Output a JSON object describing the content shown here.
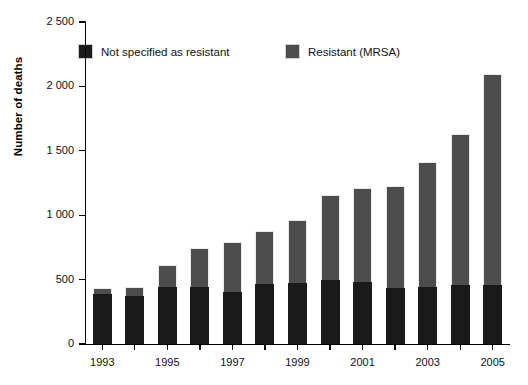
{
  "chart_data": {
    "type": "bar",
    "subtype": "stacked-bar",
    "title": "",
    "xlabel": "",
    "ylabel": "Number of deaths",
    "ylim": [
      0,
      2500
    ],
    "yticks": [
      0,
      500,
      1000,
      1500,
      2000,
      2500
    ],
    "ytick_labels": [
      "0",
      "500",
      "1 000",
      "1 500",
      "2 000",
      "2 500"
    ],
    "grid": false,
    "legend_position": "top-inside",
    "categories": [
      "1993",
      "1994",
      "1995",
      "1996",
      "1997",
      "1998",
      "1999",
      "2000",
      "2001",
      "2002",
      "2003",
      "2004",
      "2005"
    ],
    "xtick_labels_shown": [
      "1993",
      "",
      "1995",
      "",
      "1997",
      "",
      "1999",
      "",
      "2001",
      "",
      "2003",
      "",
      "2005"
    ],
    "series": [
      {
        "name": "Not specified as resistant",
        "color": "#1a1a1a",
        "values": [
          390,
          375,
          440,
          445,
          405,
          465,
          475,
          500,
          480,
          435,
          445,
          460,
          460
        ]
      },
      {
        "name": "Resistant (MRSA)",
        "color": "#4d4d4d",
        "values": [
          45,
          70,
          170,
          300,
          385,
          410,
          490,
          655,
          735,
          790,
          965,
          1170,
          1640
        ]
      }
    ],
    "totals": [
      435,
      445,
      610,
      745,
      790,
      875,
      965,
      1155,
      1215,
      1225,
      1410,
      1630,
      2100
    ]
  },
  "axis": {
    "y_title": "Number of deaths",
    "y_tick_labels": [
      "2 500",
      "2 000",
      "1 500",
      "1 000",
      "500",
      "0"
    ],
    "x_tick_labels": [
      "1993",
      "1995",
      "1997",
      "1999",
      "2001",
      "2003",
      "2005"
    ]
  },
  "legend": {
    "items": [
      {
        "label": "Not specified as resistant",
        "color": "#1a1a1a"
      },
      {
        "label": "Resistant (MRSA)",
        "color": "#4d4d4d"
      }
    ]
  },
  "colors": {
    "background": "#ffffff",
    "axis": "#000000",
    "text": "#111111",
    "series_dark": "#1a1a1a",
    "series_gray": "#4d4d4d",
    "bar_outline": "#e9e9e9"
  }
}
